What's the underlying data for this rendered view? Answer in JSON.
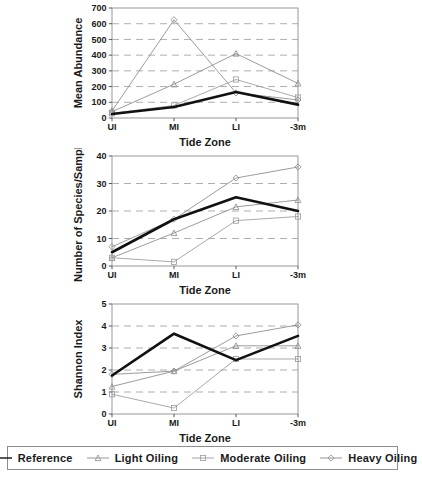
{
  "figure": {
    "axis_title_x": "Tide Zone",
    "tick_labels_x": [
      "UI",
      "MI",
      "LI",
      "-3m"
    ]
  },
  "legend": {
    "position": "bottom",
    "entries": [
      {
        "label": "Reference",
        "marker": "none",
        "line": "solid-thick",
        "color": "#111111"
      },
      {
        "label": "Light Oiling",
        "marker": "triangle-up-open",
        "line": "solid-thin",
        "color": "#8a8a8a"
      },
      {
        "label": "Moderate Oiling",
        "marker": "square-open",
        "line": "solid-thin",
        "color": "#9a9a9a"
      },
      {
        "label": "Heavy Oiling",
        "marker": "diamond-open",
        "line": "solid-thin",
        "color": "#8a8a8a"
      }
    ]
  },
  "chart_data": [
    {
      "type": "line",
      "title": "",
      "xlabel": "Tide Zone",
      "ylabel": "Mean Abundance",
      "categories": [
        "UI",
        "MI",
        "LI",
        "-3m"
      ],
      "ylim": [
        0,
        700
      ],
      "yticks": [
        0,
        100,
        200,
        300,
        400,
        500,
        600,
        700
      ],
      "grid": "horizontal-dashed",
      "legend": "bottom",
      "series": [
        {
          "name": "Reference",
          "values": [
            25,
            70,
            165,
            85
          ]
        },
        {
          "name": "Light Oiling",
          "values": [
            40,
            215,
            410,
            220
          ]
        },
        {
          "name": "Moderate Oiling",
          "values": [
            30,
            80,
            245,
            130
          ]
        },
        {
          "name": "Heavy Oiling",
          "values": [
            45,
            625,
            160,
            115
          ]
        }
      ]
    },
    {
      "type": "line",
      "title": "",
      "xlabel": "Tide Zone",
      "ylabel": "Number of Species/Sample",
      "categories": [
        "UI",
        "MI",
        "LI",
        "-3m"
      ],
      "ylim": [
        0,
        40
      ],
      "yticks": [
        0,
        10,
        20,
        30,
        40
      ],
      "grid": "horizontal-dashed",
      "legend": "bottom",
      "series": [
        {
          "name": "Reference",
          "values": [
            5,
            17,
            25,
            20
          ]
        },
        {
          "name": "Light Oiling",
          "values": [
            3,
            12,
            21.5,
            24
          ]
        },
        {
          "name": "Moderate Oiling",
          "values": [
            3,
            1.5,
            16.5,
            18
          ]
        },
        {
          "name": "Heavy Oiling",
          "values": [
            7,
            17,
            32,
            36
          ]
        }
      ]
    },
    {
      "type": "line",
      "title": "",
      "xlabel": "Tide Zone",
      "ylabel": "Shannon Index",
      "categories": [
        "UI",
        "MI",
        "LI",
        "-3m"
      ],
      "ylim": [
        0,
        5
      ],
      "yticks": [
        0,
        1,
        2,
        3,
        4,
        5
      ],
      "grid": "horizontal-dashed",
      "legend": "bottom",
      "series": [
        {
          "name": "Reference",
          "values": [
            1.75,
            3.65,
            2.45,
            3.55
          ]
        },
        {
          "name": "Light Oiling",
          "values": [
            1.25,
            1.95,
            3.1,
            3.1
          ]
        },
        {
          "name": "Moderate Oiling",
          "values": [
            0.9,
            0.27,
            2.5,
            2.5
          ]
        },
        {
          "name": "Heavy Oiling",
          "values": [
            1.8,
            1.95,
            3.55,
            4.05
          ]
        }
      ]
    }
  ]
}
